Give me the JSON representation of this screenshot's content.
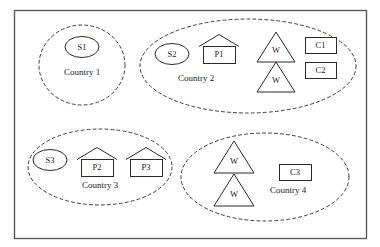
{
  "diagram": {
    "border": {
      "x": 14,
      "y": 10,
      "width": 352,
      "height": 228,
      "stroke": "#5a5a5a",
      "stroke_width": 1.4,
      "fill": "#ffffff"
    },
    "style": {
      "group_stroke": "#3d3d3d",
      "group_dash": "3,3",
      "node_stroke": "#2b2b2b",
      "node_fill": "#ffffff",
      "text_color": "#1a1a1a"
    },
    "shape_legend": [
      {
        "shape": "ellipse",
        "meaning": "supplier",
        "prefix": "S"
      },
      {
        "shape": "house",
        "meaning": "plant",
        "prefix": "P"
      },
      {
        "shape": "triangle",
        "meaning": "warehouse",
        "prefix": "W"
      },
      {
        "shape": "rectangle",
        "meaning": "customer",
        "prefix": "C"
      }
    ],
    "groups": [
      {
        "id": "country-1",
        "label": "Country 1",
        "label_x": 82,
        "label_y": 72,
        "ellipse": {
          "cx": 82,
          "cy": 65,
          "rx": 43,
          "ry": 40
        },
        "nodes": [
          {
            "id": "S1",
            "label": "S1",
            "type": "ellipse",
            "cx": 82,
            "cy": 47,
            "rx": 17,
            "ry": 10.5
          }
        ]
      },
      {
        "id": "country-2",
        "label": "Country 2",
        "label_x": 196,
        "label_y": 78,
        "ellipse": {
          "cx": 248,
          "cy": 66,
          "rx": 108,
          "ry": 47
        },
        "nodes": [
          {
            "id": "S2",
            "label": "S2",
            "type": "ellipse",
            "cx": 172,
            "cy": 54,
            "rx": 17,
            "ry": 10.5
          },
          {
            "id": "P1",
            "label": "P1",
            "type": "house",
            "x": 203,
            "y": 34,
            "width": 32,
            "height": 29,
            "roof": 12
          },
          {
            "id": "W2a",
            "label": "W",
            "type": "triangle",
            "cx": 276,
            "cy": 32,
            "width": 38,
            "height": 30
          },
          {
            "id": "W2b",
            "label": "W",
            "type": "triangle",
            "cx": 276,
            "cy": 62,
            "width": 38,
            "height": 30
          },
          {
            "id": "C1",
            "label": "C1",
            "type": "rect",
            "x": 305,
            "y": 37,
            "width": 31,
            "height": 16
          },
          {
            "id": "C2",
            "label": "C2",
            "type": "rect",
            "x": 305,
            "y": 62,
            "width": 31,
            "height": 16
          }
        ]
      },
      {
        "id": "country-3",
        "label": "Country 3",
        "label_x": 100,
        "label_y": 185,
        "ellipse": {
          "cx": 100,
          "cy": 167,
          "rx": 72,
          "ry": 38
        },
        "nodes": [
          {
            "id": "S3",
            "label": "S3",
            "type": "ellipse",
            "cx": 50,
            "cy": 160,
            "rx": 17,
            "ry": 10.5
          },
          {
            "id": "P2",
            "label": "P2",
            "type": "house",
            "x": 81,
            "y": 147,
            "width": 32,
            "height": 29,
            "roof": 12
          },
          {
            "id": "P3",
            "label": "P3",
            "type": "house",
            "x": 130,
            "y": 147,
            "width": 32,
            "height": 29,
            "roof": 12
          }
        ]
      },
      {
        "id": "country-4",
        "label": "Country 4",
        "label_x": 288,
        "label_y": 190,
        "ellipse": {
          "cx": 265,
          "cy": 177,
          "rx": 84,
          "ry": 44
        },
        "nodes": [
          {
            "id": "W4a",
            "label": "W",
            "type": "triangle",
            "cx": 234,
            "cy": 141,
            "width": 40,
            "height": 32
          },
          {
            "id": "W4b",
            "label": "W",
            "type": "triangle",
            "cx": 234,
            "cy": 174,
            "width": 40,
            "height": 32
          },
          {
            "id": "C3",
            "label": "C3",
            "type": "rect",
            "x": 279,
            "y": 164,
            "width": 32,
            "height": 16
          }
        ]
      }
    ]
  }
}
